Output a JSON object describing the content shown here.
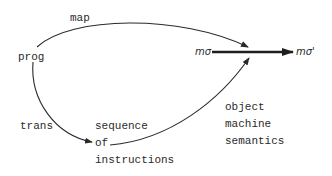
{
  "diagram": {
    "nodes": {
      "prog": "prog",
      "m_sigma": "mσ",
      "m_sigma_prime": "mσ'",
      "sequence_line1": "sequence",
      "sequence_line2": "of",
      "sequence_line3": "instructions"
    },
    "edges": {
      "map": "map",
      "trans": "trans"
    },
    "annotation": {
      "line1": "object",
      "line2": "machine",
      "line3": "semantics"
    },
    "colors": {
      "ink": "#2a2a2a",
      "background": "#ffffff"
    }
  }
}
